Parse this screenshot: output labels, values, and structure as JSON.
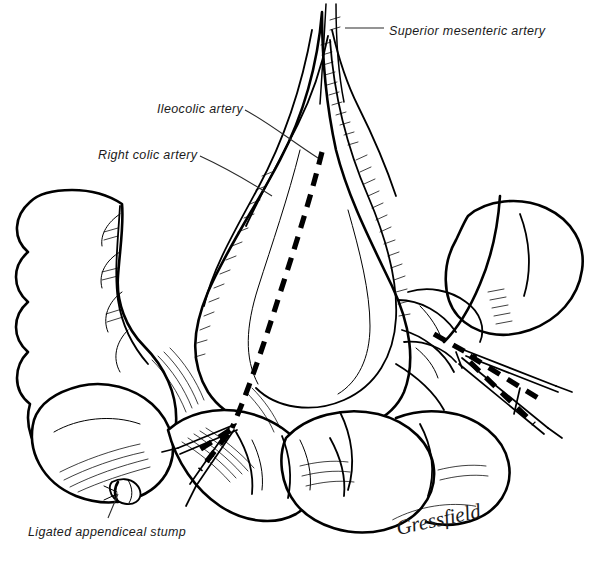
{
  "figure": {
    "background_color": "#ffffff",
    "ink_color": "#000000",
    "width": 597,
    "height": 562
  },
  "labels": [
    {
      "id": "superior-mesenteric-artery",
      "text": "Superior mesenteric artery",
      "text_x": 389,
      "text_y": 35,
      "leader": "M345,28 L384,28"
    },
    {
      "id": "ileocolic-artery",
      "text": "Ileocolic artery",
      "text_x": 157,
      "text_y": 113,
      "leader": "M245,110 C268,122 290,140 318,158"
    },
    {
      "id": "right-colic-artery",
      "text": "Right colic artery",
      "text_x": 98,
      "text_y": 159,
      "leader": "M200,156 C226,168 250,182 272,196"
    },
    {
      "id": "ligated-appendiceal-stump",
      "text": "Ligated appendiceal stump",
      "text_x": 28,
      "text_y": 536,
      "leader": "M118,494 L108,518"
    }
  ],
  "signature": {
    "id": "artist-signature",
    "text": "Gressfield",
    "x": 398,
    "y": 535,
    "rotation": -12
  },
  "anatomy": {
    "ascending_colon": "ascending-colon",
    "cecum": "cecum",
    "appendiceal_stump": "appendiceal-stump",
    "mesentery": "mesentery-fan",
    "terminal_ileum": "terminal-ileum",
    "transverse_colon": "transverse-colon",
    "small_bowel_loops": "small-bowel-loops"
  },
  "instruments": [
    {
      "id": "left-bowel-clamp",
      "side": "left"
    },
    {
      "id": "right-bowel-clamp",
      "side": "right"
    }
  ],
  "resection_lines": {
    "id": "dashed-resection-line",
    "style": "thick-dashed",
    "description": "Planned line of mesenteric and bowel division"
  }
}
